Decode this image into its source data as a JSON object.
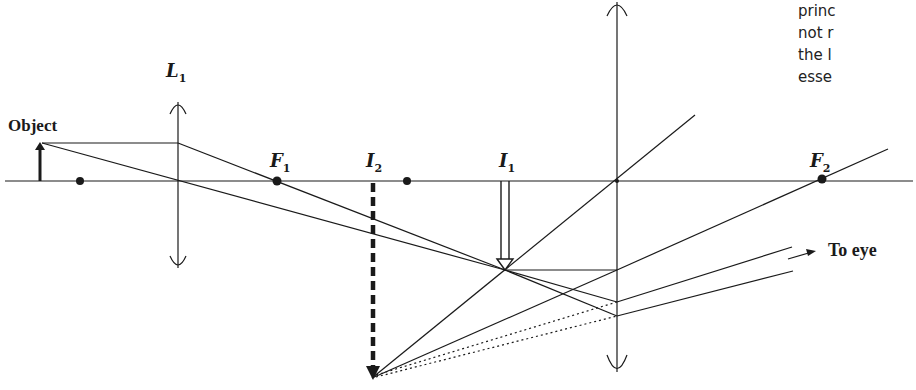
{
  "caption_lines": [
    "princ",
    "not r",
    "the l",
    "esse"
  ],
  "labels": {
    "object": "Object",
    "L1": "L",
    "L1_sub": "1",
    "F1": "F",
    "F1_sub": "1",
    "I2": "I",
    "I2_sub": "2",
    "I1": "I",
    "I1_sub": "1",
    "F2": "F",
    "F2_sub": "2",
    "to_eye": "To eye"
  },
  "colors": {
    "ink": "#1a1a1a",
    "background": "#ffffff"
  },
  "geometry": {
    "axis_y": 181,
    "objective_lens_x": 178,
    "eyepiece_lens_x": 617,
    "focal_points": {
      "F1_x": 277,
      "F2_x": 822
    },
    "extra_points_x": [
      80,
      407
    ],
    "intermediate_image_I1": {
      "x": 505,
      "tip_y": 270
    },
    "virtual_image_I2": {
      "x": 373,
      "tip_y": 378
    }
  }
}
